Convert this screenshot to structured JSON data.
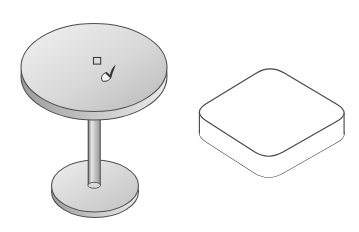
{
  "canvas": {
    "width": 359,
    "height": 232,
    "background": "#ffffff"
  },
  "objects": {
    "table": {
      "name": "pedestal-table-model",
      "shading": "shaded-gray"
    },
    "box": {
      "name": "rounded-slab-box-model",
      "shading": "wireframe-white"
    }
  },
  "icons": {
    "cursor": "paintbrush-cursor-icon",
    "marker": "square-face-marker-icon"
  },
  "colors": {
    "background": "#ffffff",
    "outline": "#4f4f4f",
    "box_outline": "#454545",
    "box_fill": "#ffffff",
    "top_light": "#f2f2f2",
    "top_mid": "#d8d8d8",
    "top_dark": "#b9b9b9",
    "rim_dark": "#9c9c9c",
    "rim_mid": "#cccccc",
    "rim_light": "#e9e9e9",
    "stem_dark": "#747474",
    "stem_highlight": "#e6e6e6",
    "stem_mid": "#c0c0c0",
    "stem_shade": "#979797",
    "stem_cap": "#d9d9d9",
    "base_light": "#eeeeee",
    "base_dark": "#c3c3c3",
    "marker_stroke": "#3c3c3c",
    "cursor_dark": "#333333",
    "cursor_light": "#f5f5f5",
    "none": "none"
  }
}
